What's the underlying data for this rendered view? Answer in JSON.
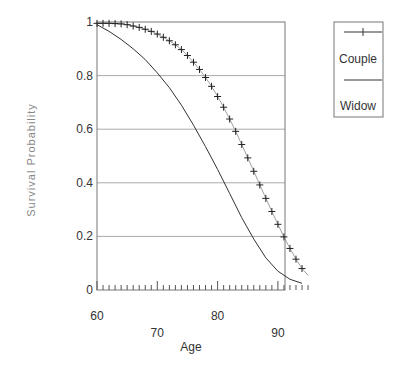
{
  "chart_data": {
    "type": "line",
    "title": "",
    "xlabel": "Age",
    "ylabel": "Survival Probability",
    "xlim": [
      60,
      95
    ],
    "ylim": [
      0,
      1
    ],
    "x_ticks_major": [
      60,
      70,
      80,
      90
    ],
    "y_ticks": [
      0,
      0.2,
      0.4,
      0.6,
      0.8,
      1
    ],
    "y_tick_labels": [
      "0",
      "0.2",
      "0.4",
      "0.6",
      "0.8",
      "1"
    ],
    "grid": "horizontal",
    "legend_position": "outside-right-top",
    "series": [
      {
        "name": "Couple",
        "marker": "+",
        "x": [
          60,
          61,
          62,
          63,
          64,
          65,
          66,
          67,
          68,
          69,
          70,
          71,
          72,
          73,
          74,
          75,
          76,
          77,
          78,
          79,
          80,
          81,
          82,
          83,
          84,
          85,
          86,
          87,
          88,
          89,
          90,
          91,
          92,
          93,
          94,
          95
        ],
        "values": [
          0.995,
          0.995,
          0.995,
          0.994,
          0.993,
          0.99,
          0.985,
          0.98,
          0.973,
          0.965,
          0.955,
          0.943,
          0.93,
          0.915,
          0.897,
          0.875,
          0.85,
          0.823,
          0.793,
          0.76,
          0.722,
          0.682,
          0.638,
          0.592,
          0.543,
          0.493,
          0.443,
          0.392,
          0.342,
          0.293,
          0.245,
          0.198,
          0.155,
          0.115,
          0.08,
          0.055
        ]
      },
      {
        "name": "Widow",
        "marker": "none",
        "x": [
          60,
          62,
          64,
          66,
          68,
          70,
          72,
          74,
          76,
          78,
          80,
          82,
          84,
          86,
          88,
          90,
          92,
          94
        ],
        "values": [
          0.99,
          0.965,
          0.935,
          0.9,
          0.86,
          0.81,
          0.755,
          0.69,
          0.615,
          0.535,
          0.45,
          0.36,
          0.27,
          0.19,
          0.12,
          0.07,
          0.04,
          0.025
        ]
      }
    ]
  },
  "legend": {
    "items": [
      {
        "label": "Couple"
      },
      {
        "label": "Widow"
      }
    ]
  },
  "axes": {
    "xlabel": "Age",
    "ylabel": "Survival Probability",
    "x_tick_labels": [
      "60",
      "70",
      "80",
      "90"
    ],
    "y_tick_labels": [
      "0",
      "0.2",
      "0.4",
      "0.6",
      "0.8",
      "1"
    ]
  }
}
